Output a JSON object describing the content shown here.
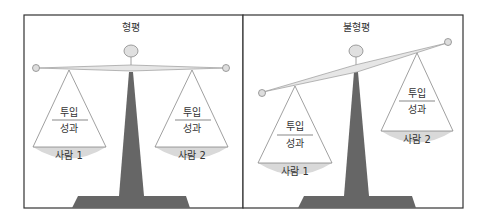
{
  "panels": [
    {
      "title": "형평",
      "state": "balanced",
      "pans": [
        {
          "numerator": "투입",
          "denominator": "성과",
          "label": "사람 1"
        },
        {
          "numerator": "투입",
          "denominator": "성과",
          "label": "사람 2"
        }
      ]
    },
    {
      "title": "불형평",
      "state": "unbalanced",
      "pans": [
        {
          "numerator": "투입",
          "denominator": "성과",
          "label": "사람 1"
        },
        {
          "numerator": "투입",
          "denominator": "성과",
          "label": "사람 2"
        }
      ]
    }
  ],
  "colors": {
    "frame": "#333333",
    "pole": "#666666",
    "bowl": "#d9d9d9",
    "knob": "#e0e0e0",
    "beam": "#e6e6e6",
    "line": "#888888"
  }
}
